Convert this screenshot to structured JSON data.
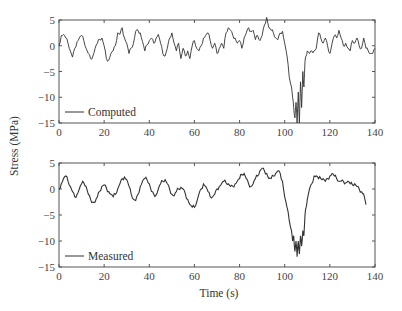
{
  "chart_data": [
    {
      "type": "line",
      "panel": "top",
      "title": "",
      "xlabel": "",
      "ylabel": "Stress (MPa)",
      "xlim": [
        0,
        140
      ],
      "ylim": [
        -15,
        5
      ],
      "xticks": [
        0,
        20,
        40,
        60,
        80,
        100,
        120,
        140
      ],
      "yticks": [
        5,
        0,
        -5,
        -10,
        -15
      ],
      "grid": false,
      "legend_position": "lower left",
      "series": [
        {
          "name": "Computed",
          "x": [
            0,
            1,
            2,
            3,
            4,
            5,
            6,
            7,
            8,
            9,
            10,
            11,
            12,
            13,
            14,
            15,
            16,
            17,
            18,
            19,
            20,
            21,
            22,
            23,
            24,
            25,
            26,
            27,
            28,
            29,
            30,
            31,
            32,
            33,
            34,
            35,
            36,
            37,
            38,
            39,
            40,
            41,
            42,
            43,
            44,
            45,
            46,
            47,
            48,
            49,
            50,
            51,
            52,
            53,
            54,
            55,
            56,
            57,
            58,
            59,
            60,
            61,
            62,
            63,
            64,
            65,
            66,
            67,
            68,
            69,
            70,
            71,
            72,
            73,
            74,
            75,
            76,
            77,
            78,
            79,
            80,
            81,
            82,
            83,
            84,
            85,
            86,
            87,
            88,
            89,
            90,
            91,
            92,
            93,
            94,
            95,
            96,
            97,
            98,
            99,
            100,
            101,
            102,
            103,
            103.5,
            104,
            104.5,
            105,
            105.5,
            106,
            106.5,
            107,
            107.5,
            108,
            108.5,
            109,
            109.5,
            110,
            111,
            112,
            113,
            114,
            115,
            116,
            117,
            118,
            119,
            120,
            121,
            122,
            123,
            124,
            125,
            126,
            127,
            128,
            129,
            130,
            131,
            132,
            133,
            134,
            135,
            136,
            137,
            138,
            139,
            140
          ],
          "values": [
            0,
            2,
            2.2,
            1.5,
            0.5,
            -1,
            -2.2,
            -0.5,
            0.8,
            1.5,
            2,
            1,
            -0.5,
            -1.5,
            -2.5,
            -2,
            -0.5,
            0.5,
            1.2,
            1.5,
            0,
            -2.5,
            -2.8,
            -1.5,
            -1,
            0,
            2.5,
            2.2,
            3.5,
            1.5,
            0.5,
            -1.5,
            -0.5,
            0.5,
            2.8,
            3,
            2.5,
            0.8,
            -1,
            0.2,
            1,
            1.5,
            0.5,
            1.5,
            2.2,
            0.5,
            -1.5,
            -2,
            -0.5,
            1.5,
            2.5,
            0.5,
            -1,
            0.5,
            -2.5,
            -0.5,
            -2,
            -1,
            -2.5,
            0,
            1,
            -0.5,
            -1,
            0,
            1.5,
            2,
            2.5,
            1,
            -0.5,
            0.5,
            -1.5,
            -0.5,
            0.5,
            -0.5,
            2.5,
            3.5,
            3,
            2,
            1.5,
            0.5,
            1,
            -0.5,
            1.5,
            2.5,
            3.5,
            2.8,
            3,
            1.2,
            2,
            1,
            2,
            4,
            5.5,
            3.5,
            3,
            2.5,
            1.5,
            1.2,
            2.5,
            2.8,
            0.5,
            -2,
            -6,
            -8,
            -10,
            -12,
            -14,
            -11,
            -15,
            -9,
            -15,
            -7,
            -12,
            -5,
            -8,
            -3,
            -2,
            -1,
            -1.5,
            -1,
            -1,
            -0.5,
            2.5,
            1.5,
            0.5,
            1.5,
            0,
            -1.5,
            0.5,
            2,
            1.5,
            3,
            1.5,
            0,
            0.5,
            -0.5,
            -1,
            1,
            0.5,
            1.5,
            0,
            -0.5,
            1.5,
            -0.5,
            -1,
            -1.5,
            -1.5,
            -0.5,
            -2
          ],
          "color": "#333333"
        }
      ]
    },
    {
      "type": "line",
      "panel": "bottom",
      "title": "",
      "xlabel": "Time (s)",
      "ylabel": "Stress (MPa)",
      "xlim": [
        0,
        140
      ],
      "ylim": [
        -15,
        5
      ],
      "xticks": [
        0,
        20,
        40,
        60,
        80,
        100,
        120,
        140
      ],
      "yticks": [
        5,
        0,
        -5,
        -10,
        -15
      ],
      "grid": false,
      "legend_position": "lower left",
      "series": [
        {
          "name": "Measured",
          "x": [
            0,
            1,
            2,
            3,
            4,
            5,
            6,
            7,
            8,
            9,
            10,
            11,
            12,
            13,
            14,
            15,
            16,
            17,
            18,
            19,
            20,
            21,
            22,
            23,
            24,
            25,
            26,
            27,
            28,
            29,
            30,
            31,
            32,
            33,
            34,
            35,
            36,
            37,
            38,
            39,
            40,
            41,
            42,
            43,
            44,
            45,
            46,
            47,
            48,
            49,
            50,
            51,
            52,
            53,
            54,
            55,
            56,
            57,
            58,
            59,
            60,
            61,
            62,
            63,
            64,
            65,
            66,
            67,
            68,
            69,
            70,
            71,
            72,
            73,
            74,
            75,
            76,
            77,
            78,
            79,
            80,
            81,
            82,
            83,
            84,
            85,
            86,
            87,
            88,
            89,
            90,
            91,
            92,
            93,
            94,
            95,
            96,
            97,
            98,
            99,
            100,
            101,
            102,
            103,
            103.5,
            104,
            104.5,
            105,
            105.5,
            106,
            106.5,
            107,
            107.5,
            108,
            108.5,
            109,
            109.5,
            110,
            111,
            112,
            113,
            114,
            115,
            116,
            117,
            118,
            119,
            120,
            121,
            122,
            123,
            124,
            125,
            126,
            127,
            128,
            129,
            130,
            131,
            132,
            133,
            134,
            135,
            136,
            137,
            138,
            139,
            140
          ],
          "values": [
            0,
            1,
            2,
            2.5,
            1.5,
            0.5,
            -0.5,
            -1.5,
            -1,
            0,
            1,
            1.2,
            0.5,
            -1,
            -2,
            -2.5,
            -2.5,
            -1.5,
            -0.5,
            0.5,
            0.8,
            0.2,
            -0.5,
            -1,
            -1.5,
            -1,
            0,
            1,
            2,
            2.3,
            1.8,
            0.5,
            -1,
            -2,
            -2.2,
            -1,
            0.5,
            1.5,
            2,
            1.8,
            1,
            -0.5,
            -1,
            -1.2,
            0,
            1,
            1.5,
            1.8,
            1,
            0,
            -1,
            -1.3,
            -0.5,
            0,
            0.3,
            0,
            -1,
            -2,
            -3,
            -3.5,
            -3.5,
            -2.5,
            -1,
            0,
            1,
            0.5,
            -0.5,
            -1.5,
            -1.5,
            -1,
            0,
            0.5,
            1,
            1.5,
            1.2,
            1,
            0.5,
            0.5,
            1,
            1.5,
            2,
            2.8,
            3,
            2,
            1,
            0.5,
            1,
            2,
            2.5,
            3.5,
            4,
            3.5,
            3,
            2,
            2,
            2.5,
            3,
            3.5,
            3,
            1.5,
            -1.5,
            -3.5,
            -6,
            -8,
            -10,
            -9,
            -12,
            -10,
            -13,
            -10,
            -12.5,
            -9,
            -11,
            -8,
            -9,
            -5,
            -3.5,
            -2,
            0,
            1,
            2.5,
            2.5,
            2,
            2,
            2,
            1.5,
            2,
            2.5,
            3,
            2.5,
            2,
            1.5,
            1.5,
            1.5,
            1.2,
            1.5,
            1,
            0.8,
            1,
            0.5,
            0,
            -0.5,
            -1,
            -3
          ],
          "color": "#333333"
        }
      ]
    }
  ],
  "figure": {
    "ylabel": "Stress (MPa)",
    "xlabel": "Time (s)",
    "top_legend": "Computed",
    "bottom_legend": "Measured",
    "xtick_labels": [
      "0",
      "20",
      "40",
      "60",
      "80",
      "100",
      "120",
      "140"
    ],
    "ytick_labels": [
      "5",
      "0",
      "−5",
      "−10",
      "−15"
    ]
  }
}
